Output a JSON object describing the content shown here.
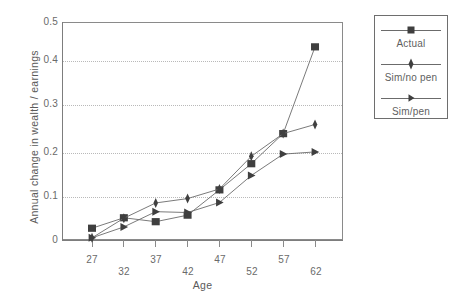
{
  "chart_data": {
    "type": "line",
    "title": "",
    "xlabel": "Age",
    "ylabel": "Annual change in wealth / earnings",
    "categories": [
      "27",
      "32",
      "37",
      "42",
      "47",
      "52",
      "57",
      "62"
    ],
    "x": [
      27,
      32,
      37,
      42,
      47,
      52,
      57,
      62
    ],
    "xlim": [
      24.5,
      64.5
    ],
    "ylim": [
      0,
      0.5
    ],
    "grid": true,
    "grid_style": "dotted-horizontal",
    "legend_position": "right-outside",
    "y_ticks": [
      "0",
      "0.1",
      "0.2",
      "0.3",
      "0.4",
      "0.5"
    ],
    "y_tick_values": [
      0,
      0.1,
      0.2,
      0.3,
      0.4,
      0.5
    ],
    "x_ticks": [
      "27",
      "32",
      "37",
      "42",
      "47",
      "52",
      "57",
      "62"
    ],
    "series": [
      {
        "name": "Actual",
        "marker": "square",
        "color": "#4a4a4a",
        "values": [
          0.027,
          0.051,
          0.042,
          0.057,
          0.115,
          0.175,
          0.244,
          0.443
        ]
      },
      {
        "name": "Sim/no pen",
        "marker": "diamond",
        "color": "#4a4a4a",
        "values": [
          0.005,
          0.05,
          0.085,
          0.095,
          0.117,
          0.192,
          0.244,
          0.265
        ]
      },
      {
        "name": "Sim/pen",
        "marker": "triangle-right",
        "color": "#4a4a4a",
        "values": [
          0.005,
          0.03,
          0.065,
          0.063,
          0.086,
          0.148,
          0.197,
          0.202
        ]
      }
    ]
  },
  "legend": {
    "entries": [
      {
        "label": "Actual",
        "marker": "square"
      },
      {
        "label": "Sim/no pen",
        "marker": "diamond"
      },
      {
        "label": "Sim/pen",
        "marker": "triangle-right"
      }
    ]
  },
  "colors": {
    "line": "#6b6b6b",
    "marker": "#3f3f3f",
    "axis": "#7d7d7d",
    "grid": "#b9b9b9",
    "text": "#5f5f5f",
    "background": "#ffffff"
  }
}
